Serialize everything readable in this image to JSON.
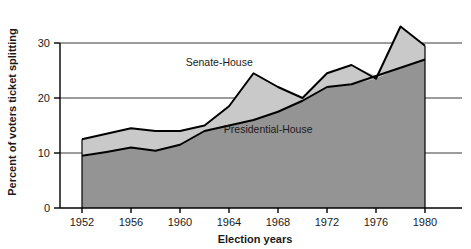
{
  "chart_data": {
    "type": "area",
    "title": "",
    "xlabel": "Election years",
    "ylabel": "Percent of voters ticket splitting",
    "xlim": [
      1952,
      1980
    ],
    "ylim": [
      0,
      35
    ],
    "grid": "horizontal",
    "legend_position": "inline-annotations",
    "x_tick_labels": [
      "1952",
      "1956",
      "1960",
      "1964",
      "1968",
      "1972",
      "1976",
      "1980"
    ],
    "x_tick_values": [
      1952,
      1956,
      1960,
      1964,
      1968,
      1972,
      1976,
      1980
    ],
    "y_tick_labels": [
      "0",
      "10",
      "20",
      "30"
    ],
    "y_tick_values": [
      0,
      10,
      20,
      30
    ],
    "gridline_values": [
      10,
      20,
      30
    ],
    "x": [
      1952,
      1954,
      1956,
      1958,
      1960,
      1962,
      1964,
      1966,
      1968,
      1970,
      1972,
      1974,
      1976,
      1978,
      1980
    ],
    "series": [
      {
        "name": "Senate-House",
        "values": [
          12.5,
          13.5,
          14.5,
          14.0,
          14.0,
          15.0,
          18.5,
          24.5,
          22.0,
          20.0,
          24.5,
          26.0,
          23.5,
          33.0,
          29.5
        ],
        "fill_color": "#c9c9c9",
        "line_color": "#000000"
      },
      {
        "name": "Presidential-House",
        "values": [
          9.5,
          10.2,
          11.0,
          10.4,
          11.5,
          14.0,
          15.0,
          16.0,
          17.5,
          19.5,
          22.0,
          22.5,
          24.0,
          25.5,
          27.0
        ],
        "fill_color": "#949494",
        "line_color": "#000000"
      }
    ],
    "annotations": [
      {
        "text": "Senate-House",
        "x": 1963.2,
        "y": 25.8
      },
      {
        "text": "Presidential-House",
        "x": 1967.2,
        "y": 13.6
      }
    ]
  },
  "colors": {
    "background": "#ffffff",
    "axis": "#000000",
    "gridline": "#3a3a3a",
    "upper_band": "#c9c9c9",
    "lower_band": "#949494",
    "text": "#1a1a1a"
  }
}
